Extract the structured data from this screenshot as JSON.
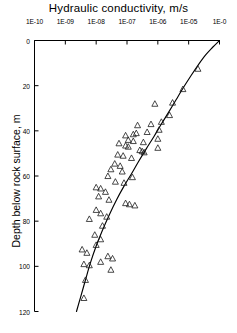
{
  "chart_data": {
    "type": "scatter",
    "title": "Hydraulic conductivity,  m/s",
    "xlabel": "Hydraulic conductivity, m/s",
    "ylabel": "Depth below rock surface,  m",
    "xscale": "log",
    "xlim": [
      1e-10,
      0.0001
    ],
    "ylim": [
      0,
      120
    ],
    "y_inverted": true,
    "grid": false,
    "legend": null,
    "xtick_labels": [
      "1E-10",
      "1E-09",
      "1E-08",
      "1E-07",
      "1E-06",
      "1E-05",
      "1E-0"
    ],
    "xtick_values": [
      1e-10,
      1e-09,
      1e-08,
      1e-07,
      1e-06,
      1e-05,
      0.0001
    ],
    "ytick_labels": [
      "0",
      "20",
      "40",
      "60",
      "80",
      "100",
      "120"
    ],
    "ytick_values": [
      0,
      20,
      40,
      60,
      80,
      100,
      120
    ],
    "marker": "open-triangle",
    "series": [
      {
        "name": "Measured hydraulic conductivity",
        "points": [
          [
            2e-05,
            12.5
          ],
          [
            6.5e-06,
            21.5
          ],
          [
            3e-06,
            27.5
          ],
          [
            8e-07,
            28.0
          ],
          [
            2.4e-06,
            33.0
          ],
          [
            1.3e-06,
            36.0
          ],
          [
            6e-07,
            37.0
          ],
          [
            2.2e-07,
            37.5
          ],
          [
            1.1e-06,
            39.5
          ],
          [
            4.5e-07,
            40.5
          ],
          [
            2e-07,
            41.0
          ],
          [
            1.6e-07,
            41.5
          ],
          [
            9e-08,
            42.0
          ],
          [
            1e-06,
            43.5
          ],
          [
            1.1e-07,
            44.0
          ],
          [
            1.6e-07,
            44.5
          ],
          [
            3.4e-07,
            45.0
          ],
          [
            5.5e-08,
            45.5
          ],
          [
            9e-08,
            46.5
          ],
          [
            1.1e-07,
            47.0
          ],
          [
            1e-06,
            47.5
          ],
          [
            2.6e-07,
            48.5
          ],
          [
            3.1e-07,
            49.0
          ],
          [
            3.6e-07,
            49.5
          ],
          [
            5e-08,
            50.5
          ],
          [
            7.5e-08,
            51.0
          ],
          [
            1.4e-07,
            52.0
          ],
          [
            4e-08,
            54.5
          ],
          [
            6e-08,
            55.5
          ],
          [
            3e-08,
            57.0
          ],
          [
            7e-08,
            58.0
          ],
          [
            2.4e-08,
            60.0
          ],
          [
            1.5e-07,
            60.5
          ],
          [
            4.2e-08,
            62.5
          ],
          [
            8e-08,
            63.0
          ],
          [
            1e-08,
            65.0
          ],
          [
            1.4e-08,
            65.5
          ],
          [
            2e-08,
            67.0
          ],
          [
            1.2e-08,
            69.0
          ],
          [
            2.6e-08,
            70.5
          ],
          [
            9e-08,
            72.0
          ],
          [
            1.2e-07,
            72.5
          ],
          [
            1.8e-07,
            73.0
          ],
          [
            1e-08,
            75.0
          ],
          [
            1.4e-08,
            76.5
          ],
          [
            2.2e-08,
            78.0
          ],
          [
            6e-09,
            79.0
          ],
          [
            1.6e-08,
            82.0
          ],
          [
            9e-09,
            86.0
          ],
          [
            1.4e-08,
            88.0
          ],
          [
            1e-08,
            90.5
          ],
          [
            3.5e-09,
            92.5
          ],
          [
            5e-09,
            94.0
          ],
          [
            2.4e-08,
            95.5
          ],
          [
            3.4e-08,
            96.5
          ],
          [
            1.4e-08,
            98.0
          ],
          [
            4e-09,
            99.0
          ],
          [
            6e-09,
            99.5
          ],
          [
            3e-08,
            101.5
          ],
          [
            4.5e-09,
            106.0
          ],
          [
            4e-09,
            114.0
          ]
        ]
      }
    ],
    "fit_curve": {
      "name": "Fitted trend line",
      "points": [
        [
          0.0001,
          0.0
        ],
        [
          6e-05,
          3.0
        ],
        [
          3.5e-05,
          6.5
        ],
        [
          2e-05,
          11.0
        ],
        [
          1.2e-05,
          15.5
        ],
        [
          7e-06,
          20.5
        ],
        [
          4e-06,
          26.0
        ],
        [
          2.3e-06,
          31.5
        ],
        [
          1.3e-06,
          37.0
        ],
        [
          7.5e-07,
          42.5
        ],
        [
          4.2e-07,
          48.0
        ],
        [
          2.4e-07,
          53.5
        ],
        [
          1.4e-07,
          59.0
        ],
        [
          8e-08,
          64.5
        ],
        [
          4.6e-08,
          70.5
        ],
        [
          2.7e-08,
          77.0
        ],
        [
          1.6e-08,
          84.0
        ],
        [
          1e-08,
          91.0
        ],
        [
          6.5e-09,
          98.5
        ],
        [
          4.4e-09,
          106.5
        ],
        [
          3e-09,
          114.5
        ],
        [
          2.3e-09,
          120.0
        ]
      ]
    },
    "colors": {
      "axis": "#000000",
      "marker_stroke": "#1a1a1a",
      "marker_fill": "none",
      "curve": "#000000",
      "background": "#ffffff"
    }
  }
}
